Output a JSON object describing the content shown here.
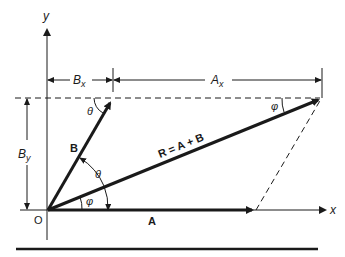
{
  "diagram": {
    "type": "vector-addition-parallelogram",
    "labels": {
      "y_axis": "y",
      "x_axis": "x",
      "origin": "O",
      "vector_a": "A",
      "vector_b": "B",
      "resultant": "R = A + B",
      "bx": "B",
      "bx_sub": "x",
      "ax": "A",
      "ax_sub": "x",
      "by": "B",
      "by_sub": "y",
      "theta_top": "θ",
      "theta_mid": "θ",
      "phi_bottom": "φ",
      "phi_top": "φ"
    },
    "colors": {
      "ink": "#1a1a1a",
      "background": "#ffffff"
    }
  }
}
